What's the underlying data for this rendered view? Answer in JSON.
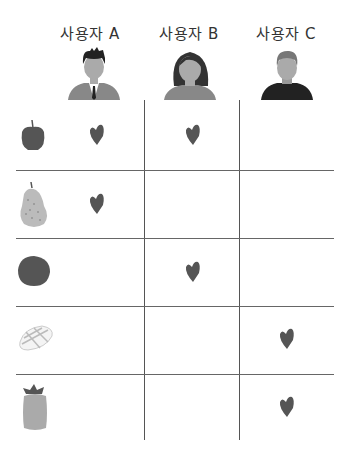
{
  "users": [
    {
      "label": "사용자 A",
      "icon": "man-suit-avatar-icon"
    },
    {
      "label": "사용자 B",
      "icon": "woman-avatar-icon"
    },
    {
      "label": "사용자 C",
      "icon": "man-sweater-avatar-icon"
    }
  ],
  "rows": [
    {
      "item": "apple",
      "icon": "apple-icon",
      "likes": [
        true,
        true,
        false
      ]
    },
    {
      "item": "pear",
      "icon": "pear-icon",
      "likes": [
        true,
        false,
        false
      ]
    },
    {
      "item": "kiwi",
      "icon": "kiwi-icon",
      "likes": [
        false,
        true,
        false
      ]
    },
    {
      "item": "mango",
      "icon": "mango-icon",
      "likes": [
        false,
        false,
        true
      ]
    },
    {
      "item": "pineapple",
      "icon": "pineapple-icon",
      "likes": [
        false,
        false,
        true
      ]
    }
  ],
  "colors": {
    "heart": "#555555",
    "line": "#555555",
    "text": "#333333"
  }
}
